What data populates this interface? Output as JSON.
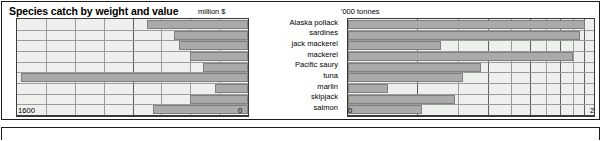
{
  "panel": {
    "title": "Species catch by weight and value"
  },
  "charts": {
    "left": {
      "unit_label": "million $",
      "axis_min_label": "0",
      "axis_max_label": "1600",
      "axis_reversed": true
    },
    "right": {
      "unit_label": "'000 tonnes",
      "axis_min_label": "0",
      "axis_max_label": "2",
      "axis_log": true
    }
  },
  "categories": [
    "Alaska pollack",
    "sardines",
    "jack mackerel",
    "mackerel",
    "Pacific saury",
    "tuna",
    "marlin",
    "skipjack",
    "salmon"
  ],
  "chart_data": [
    {
      "type": "bar",
      "orientation": "horizontal",
      "title": "Species catch by weight and value",
      "subtitle": "value",
      "xlabel": "million $",
      "ylabel": "",
      "categories": [
        "Alaska pollack",
        "sardines",
        "jack mackerel",
        "mackerel",
        "Pacific saury",
        "tuna",
        "marlin",
        "skipjack",
        "salmon"
      ],
      "values": [
        700,
        510,
        480,
        400,
        310,
        1570,
        230,
        400,
        660
      ],
      "xlim": [
        1600,
        0
      ],
      "axis_reversed": true,
      "grid": true,
      "legend": "none",
      "bar_color": "#a9aaa9",
      "plot_bg": "#eef0ee"
    },
    {
      "type": "bar",
      "orientation": "horizontal",
      "title": "Species catch by weight and value",
      "subtitle": "weight",
      "xlabel": "'000 tonnes",
      "ylabel": "",
      "categories": [
        "Alaska pollack",
        "sardines",
        "jack mackerel",
        "mackerel",
        "Pacific saury",
        "tuna",
        "marlin",
        "skipjack",
        "salmon"
      ],
      "values": [
        1.82,
        1.72,
        0.31,
        1.6,
        0.55,
        0.43,
        0.1,
        0.38,
        0.22
      ],
      "xlim": [
        0,
        2
      ],
      "scale": "log",
      "grid": true,
      "legend": "none",
      "bar_color": "#a9aaa9",
      "plot_bg": "#eef0ee"
    }
  ]
}
